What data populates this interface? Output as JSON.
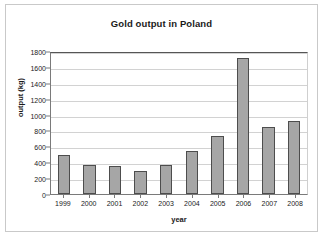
{
  "chart_data": {
    "type": "bar",
    "title": "Gold output in Poland",
    "xlabel": "year",
    "ylabel": "output (kg)",
    "categories": [
      "1999",
      "2000",
      "2001",
      "2002",
      "2003",
      "2004",
      "2005",
      "2006",
      "2007",
      "2008"
    ],
    "values": [
      490,
      370,
      350,
      295,
      360,
      540,
      725,
      1715,
      845,
      920
    ],
    "ylim": [
      0,
      1800
    ],
    "yticks": [
      0,
      200,
      400,
      600,
      800,
      1000,
      1200,
      1400,
      1600,
      1800
    ],
    "ytick_labels": [
      "0",
      "200",
      "400",
      "600",
      "800",
      "1000",
      "1200",
      "1400",
      "1600",
      "1800"
    ],
    "grid": true,
    "legend": false,
    "bar_color": "#a6a6a6",
    "bar_border_color": "#4d4d4d",
    "gridline_color": "#d2d2d2",
    "axis_color": "#7a7a7a",
    "text_color": "#1a1a1a",
    "background": "#ffffff",
    "frame_border_color": "#c9c9c9"
  }
}
